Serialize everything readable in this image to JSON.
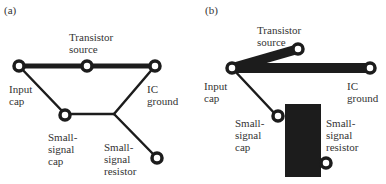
{
  "panels": [
    {
      "tag": "(a)",
      "labels": {
        "transistor_source": "Transistor\nsource",
        "input_cap": "Input\ncap",
        "ic_ground": "IC\nground",
        "small_signal_cap": "Small-\nsignal\ncap",
        "small_signal_resistor": "Small-\nsignal\nresistor"
      }
    },
    {
      "tag": "(b)",
      "labels": {
        "transistor_source": "Transistor\nsource",
        "input_cap": "Input\ncap",
        "ic_ground": "IC\nground",
        "small_signal_cap": "Small-\nsignal\ncap",
        "small_signal_resistor": "Small-\nsignal\nresistor"
      }
    }
  ],
  "colors": {
    "trace": "#1c1c1c",
    "background": "#ffffff"
  }
}
